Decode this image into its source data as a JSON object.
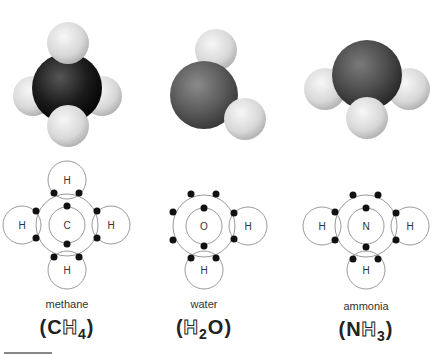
{
  "molecules": [
    {
      "name": "methane",
      "formula": {
        "open": "(",
        "central": "C",
        "h": "H",
        "sub": "4",
        "close": ")"
      },
      "central_atom": "C",
      "hydrogen_label": "H",
      "central_color": "#1a1a1a"
    },
    {
      "name": "water",
      "formula": {
        "open": "(",
        "h": "H",
        "sub": "2",
        "central": "O",
        "close": ")"
      },
      "central_atom": "O",
      "hydrogen_label": "H",
      "central_color": "#5a5a5a"
    },
    {
      "name": "ammonia",
      "formula": {
        "open": "(",
        "central": "N",
        "h": "H",
        "sub": "3",
        "close": ")"
      },
      "central_atom": "N",
      "hydrogen_label": "H",
      "central_color": "#4a4a4a"
    }
  ],
  "colors": {
    "hydrogen": "#e6e6e6",
    "line": "#888888",
    "electron": "#111111"
  }
}
